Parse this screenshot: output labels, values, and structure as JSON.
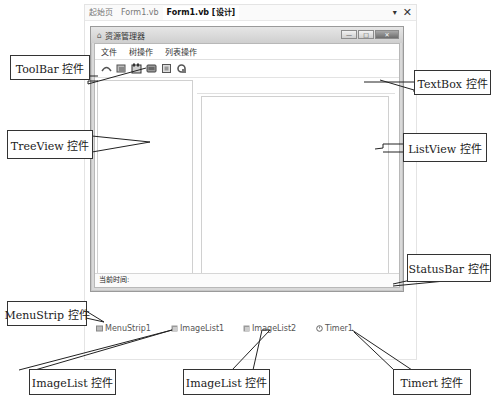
{
  "ide": {
    "tabs": [
      {
        "label": "起始页",
        "active": false
      },
      {
        "label": "Form1.vb",
        "active": false
      },
      {
        "label": "Form1.vb [设计]",
        "active": true
      }
    ],
    "dropdown_icon": "▾",
    "close_icon": "✕"
  },
  "form": {
    "title": "资源管理器",
    "title_icon": "form-icon",
    "window_buttons": {
      "minimize": "—",
      "maximize": "□",
      "close": "✕"
    },
    "menu": [
      {
        "label": "文件"
      },
      {
        "label": "树操作"
      },
      {
        "label": "列表操作"
      }
    ],
    "toolbar_buttons": [
      {
        "icon": "back-icon"
      },
      {
        "icon": "forward-icon"
      },
      {
        "icon": "folder-up-icon"
      },
      {
        "icon": "view-icon"
      },
      {
        "icon": "list-icon"
      },
      {
        "icon": "refresh-icon"
      }
    ],
    "status_text": "当前时间:"
  },
  "tray": [
    {
      "label": "MenuStrip1",
      "icon": "menustrip-icon"
    },
    {
      "label": "ImageList1",
      "icon": "imagelist-icon"
    },
    {
      "label": "ImageList2",
      "icon": "imagelist-icon"
    },
    {
      "label": "Timer1",
      "icon": "timer-icon"
    }
  ],
  "callouts": {
    "toolbar": "ToolBar 控件",
    "textbox": "TextBox 控件",
    "treeview": "TreeView 控件",
    "listview": "ListView 控件",
    "statusbar": "StatusBar 控件",
    "menustrip": "MenuStrip 控件",
    "imagelist1": "ImageList 控件",
    "imagelist2": "ImageList 控件",
    "timer": "Timert 控件"
  }
}
